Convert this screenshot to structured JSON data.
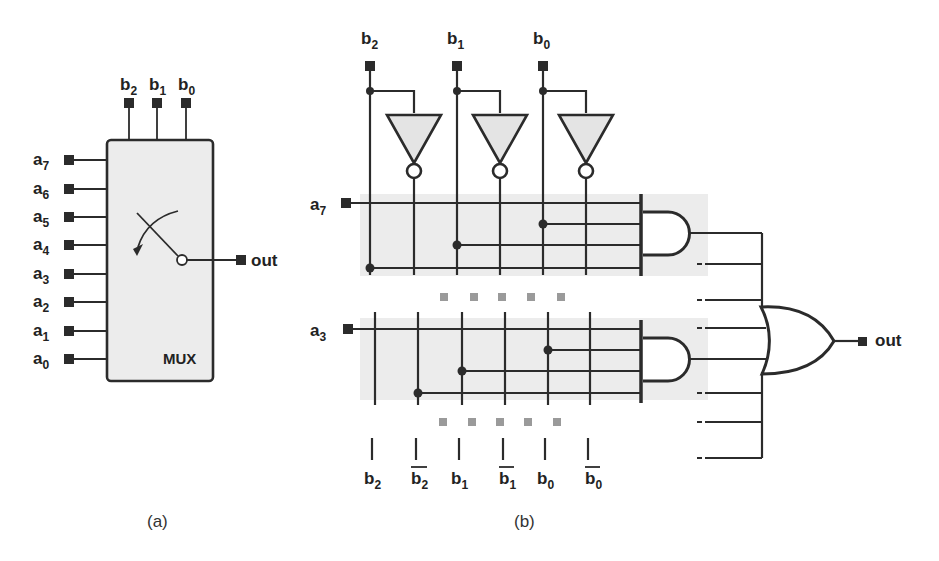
{
  "figure": {
    "panel_a": {
      "caption": "(a)",
      "block_label": "MUX",
      "select_inputs": [
        {
          "name": "b",
          "sub": "2"
        },
        {
          "name": "b",
          "sub": "1"
        },
        {
          "name": "b",
          "sub": "0"
        }
      ],
      "data_inputs": [
        {
          "name": "a",
          "sub": "7"
        },
        {
          "name": "a",
          "sub": "6"
        },
        {
          "name": "a",
          "sub": "5"
        },
        {
          "name": "a",
          "sub": "4"
        },
        {
          "name": "a",
          "sub": "3"
        },
        {
          "name": "a",
          "sub": "2"
        },
        {
          "name": "a",
          "sub": "1"
        },
        {
          "name": "a",
          "sub": "0"
        }
      ],
      "output_label": "out",
      "symbol": "switch-arrow"
    },
    "panel_b": {
      "caption": "(b)",
      "select_inputs": [
        {
          "name": "b",
          "sub": "2"
        },
        {
          "name": "b",
          "sub": "1"
        },
        {
          "name": "b",
          "sub": "0"
        }
      ],
      "bus_labels": [
        {
          "name": "b",
          "sub": "2",
          "inverted": false
        },
        {
          "name": "b",
          "sub": "2",
          "inverted": true
        },
        {
          "name": "b",
          "sub": "1",
          "inverted": false
        },
        {
          "name": "b",
          "sub": "1",
          "inverted": true
        },
        {
          "name": "b",
          "sub": "0",
          "inverted": false
        },
        {
          "name": "b",
          "sub": "0",
          "inverted": true
        }
      ],
      "and_rows": [
        {
          "input": {
            "name": "a",
            "sub": "7"
          },
          "taps": [
            "b2",
            "b1",
            "b0"
          ]
        },
        {
          "input": {
            "name": "a",
            "sub": "3"
          },
          "taps": [
            "b2_bar",
            "b1",
            "b0"
          ]
        }
      ],
      "gates": {
        "inverters": 3,
        "and_gates_shown": 2,
        "or_inputs": 8
      },
      "output_label": "out",
      "ellipsis": "■ ■ ■ ■ ■"
    }
  },
  "colors": {
    "ink": "#2b2b2b",
    "block_fill": "#ececec",
    "inverter_fill": "#e4e4e4",
    "ellipsis": "#9a9a9a",
    "background": "#ffffff"
  }
}
